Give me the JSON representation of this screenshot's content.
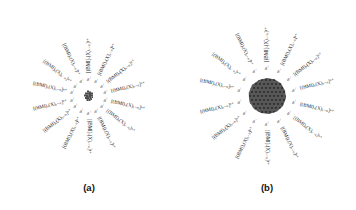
{
  "figure": {
    "background": "#ffffff",
    "ink_color": "#1b1b1b",
    "particle_color": "#4a4a4a"
  },
  "panels": [
    {
      "id": "a",
      "caption": "(a)",
      "particle": {
        "style": "small-cluster",
        "radius_px": 7
      },
      "label_radius": 60,
      "charge_symbol": "δ",
      "charge_sign": "+",
      "charge_count": 14,
      "charge_radius": 17,
      "labels": [
        {
          "text": "[(BMI)ₓ(X)ₓ₋ₙ]ⁿ⁺",
          "angle": -90
        },
        {
          "text": "[(BMI)ₓ(X)ₓ₋ₙ]ⁿ⁺",
          "angle": -64
        },
        {
          "text": "[(BMI)ₓ(X)ₓ₋ₙ]ⁿ⁺",
          "angle": -38
        },
        {
          "text": "[(BMI)ₓ(X)ₓ₋ₙ]ⁿ⁺",
          "angle": -13
        },
        {
          "text": "[(BMI)ₓ(X)ₓ₋ₙ]ⁿ⁺",
          "angle": 13
        },
        {
          "text": "[(BMI)ₓ(X)ₓ₋ₙ]ⁿ⁺",
          "angle": 38
        },
        {
          "text": "[(BMI)ₓ(X)ₓ₋ₙ]ⁿ⁺",
          "angle": 64
        },
        {
          "text": "[(BMI)ₓ(X)ₓ₋ₙ]ⁿ⁺",
          "angle": 90
        },
        {
          "text": "[(BMI)ₓ(X)ₓ₋ₙ]ⁿ⁺",
          "angle": 116
        },
        {
          "text": "[(BMI)ₓ(X)ₓ₋ₙ]ⁿ⁺",
          "angle": 142
        },
        {
          "text": "[(BMI)ₓ(X)ₓ₋ₙ]ⁿ⁺",
          "angle": 167
        },
        {
          "text": "[(BMI)ₓ(X)ₓ₋ₙ]ⁿ⁺",
          "angle": 193
        },
        {
          "text": "[(BMI)ₓ(X)ₓ₋ₙ]ⁿ⁺",
          "angle": 218
        },
        {
          "text": "[(BMI)ₓ(X)ₓ₋ₙ]ⁿ⁺",
          "angle": 244
        }
      ]
    },
    {
      "id": "b",
      "caption": "(b)",
      "particle": {
        "style": "large-sphere",
        "radius_px": 20
      },
      "label_radius": 62,
      "charge_symbol": "δ",
      "charge_sign": "+",
      "charge_count": 14,
      "charge_radius": 28,
      "labels": [
        {
          "text": "[(BMI)ₓ(X)ₓ₋ₙ]ⁿ⁺",
          "angle": -90
        },
        {
          "text": "[(BMI)ₓ(X)ₓ₋ₙ]ⁿ⁺",
          "angle": -64
        },
        {
          "text": "[(BMI)ₓ(X)ₓ₋ₙ]ⁿ⁺",
          "angle": -38
        },
        {
          "text": "[(BMI)ₓ(X)ₓ₋ₙ]ⁿ⁺",
          "angle": -13
        },
        {
          "text": "[(BMI)ₓ(X)ₓ₋ₙ]ⁿ⁺",
          "angle": 13
        },
        {
          "text": "[(BMI)ₓ(X)ₓ₋ₙ]ⁿ⁺",
          "angle": 38
        },
        {
          "text": "[(BMI)ₓ(X)ₓ₋ₙ]ⁿ⁺",
          "angle": 64
        },
        {
          "text": "[(BMI)ₓ(X)ₓ₋ₙ]ⁿ⁺",
          "angle": 90
        },
        {
          "text": "[(BMI)ₓ(X)ₓ₋ₙ]ⁿ⁺",
          "angle": 116
        },
        {
          "text": "[(BMI)ₓ(X)ₓ₋ₙ]ⁿ⁺",
          "angle": 142
        },
        {
          "text": "[(BMI)ₓ(X)ₓ₋ₙ]ⁿ⁺",
          "angle": 167
        },
        {
          "text": "[(BMI)ₓ(X)ₓ₋ₙ]ⁿ⁺",
          "angle": 193
        },
        {
          "text": "[(BMI)ₓ(X)ₓ₋ₙ]ⁿ⁺",
          "angle": 218
        },
        {
          "text": "[(BMI)ₓ(X)ₓ₋ₙ]ⁿ⁺",
          "angle": 244
        }
      ]
    }
  ]
}
